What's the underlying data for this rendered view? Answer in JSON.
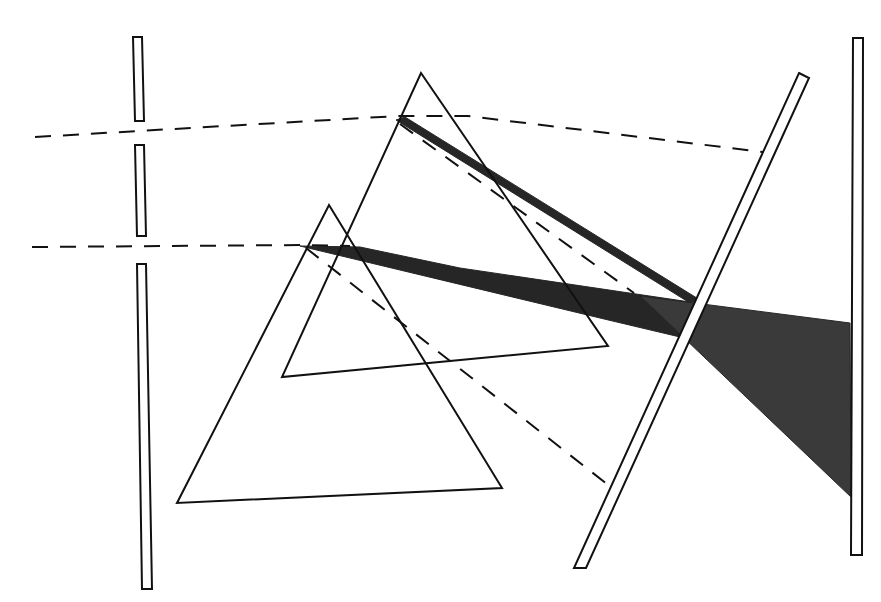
{
  "diagram": {
    "width": 881,
    "height": 602,
    "background": "#ffffff",
    "ink": "#111111",
    "beam_fill": "#262626",
    "beam_fill_light": "#3a3a3a",
    "slits": [
      {
        "name": "slit-plate-top",
        "points": "133,37 142,37 144,121 135,121"
      },
      {
        "name": "slit-plate-middle",
        "points": "135,145 144,145 146,236 137,236"
      },
      {
        "name": "slit-plate-bottom",
        "points": "137,264 146,264 152,589 142,589"
      }
    ],
    "prisms": [
      {
        "name": "prism-large-back",
        "points": "421,73 608,346 282,377"
      },
      {
        "name": "prism-small-front",
        "points": "329,205 502,488 177,503"
      }
    ],
    "screens": [
      {
        "name": "angled-screen",
        "points": "799,73 809,78 586,568 574,568"
      },
      {
        "name": "vertical-screen",
        "points": "853,38 863,38 862,555 851,555"
      }
    ],
    "incident_rays": [
      {
        "name": "incident-ray-upper",
        "d": "M35,137 L398,116 L468,116 L763,152"
      },
      {
        "name": "incident-ray-lower",
        "d": "M32,247 L301,245 L350,246"
      }
    ],
    "undeviated_rays": [
      {
        "name": "undeviated-ray-upper",
        "d": "M400,124 L634,293"
      },
      {
        "name": "undeviated-ray-lower",
        "d": "M306,248 L612,488"
      }
    ],
    "dispersed_beams": [
      {
        "name": "dispersed-beam-upper",
        "points": "396,120 405,117 700,300 690,303"
      },
      {
        "name": "dispersed-beam-lower",
        "points": "300,246 360,247 460,268 690,302 680,337 600,318"
      },
      {
        "name": "spectrum-fan",
        "points": "640,296 850,323 851,497"
      }
    ]
  }
}
